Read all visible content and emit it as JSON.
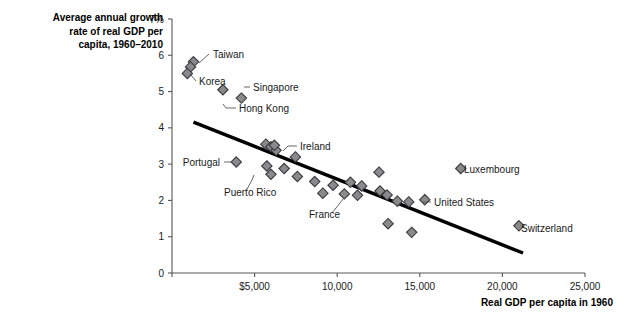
{
  "chart_data": {
    "type": "scatter",
    "title_lines": [
      "Average annual growth",
      "rate of real GDP per",
      "capita, 1960–2010"
    ],
    "xlabel": "Real GDP per capita in 1960",
    "ylabel": "Average annual growth rate of real GDP per capita, 1960–2010",
    "xlim": [
      0,
      25000
    ],
    "ylim": [
      0,
      7
    ],
    "grid": false,
    "legend": "none",
    "x_ticks": [
      {
        "value": 0,
        "label": ""
      },
      {
        "value": 5000,
        "label": "$5,000"
      },
      {
        "value": 10000,
        "label": "10,000"
      },
      {
        "value": 15000,
        "label": "15,000"
      },
      {
        "value": 20000,
        "label": "20,000"
      },
      {
        "value": 25000,
        "label": "25,000"
      }
    ],
    "y_ticks": [
      {
        "value": 0,
        "label": "0"
      },
      {
        "value": 1,
        "label": "1"
      },
      {
        "value": 2,
        "label": "2"
      },
      {
        "value": 3,
        "label": "3"
      },
      {
        "value": 4,
        "label": "4"
      },
      {
        "value": 5,
        "label": "5"
      },
      {
        "value": 6,
        "label": "6"
      },
      {
        "value": 7,
        "label": "7%"
      }
    ],
    "marker": {
      "shape": "diamond",
      "fill": "#8a8a8c",
      "edge": "#3a3a3c",
      "size": 8
    },
    "trend_line": {
      "color": "#000000",
      "width": 3.4,
      "x_start": 1300,
      "y_start": 4.16,
      "x_end": 21250,
      "y_end": 0.55
    },
    "points": [
      {
        "label": "Taiwan",
        "x": 1300,
        "y": 5.82
      },
      {
        "label": "",
        "x": 1120,
        "y": 5.68
      },
      {
        "label": "Korea",
        "x": 930,
        "y": 5.5
      },
      {
        "label": "Hong Kong",
        "x": 3080,
        "y": 5.05
      },
      {
        "label": "Singapore",
        "x": 4200,
        "y": 4.82
      },
      {
        "label": "",
        "x": 5680,
        "y": 3.55
      },
      {
        "label": "",
        "x": 5990,
        "y": 3.48
      },
      {
        "label": "",
        "x": 6300,
        "y": 3.38
      },
      {
        "label": "Portugal",
        "x": 3890,
        "y": 3.06
      },
      {
        "label": "",
        "x": 5740,
        "y": 2.95
      },
      {
        "label": "Puerto Rico",
        "x": 5990,
        "y": 2.72
      },
      {
        "label": "",
        "x": 6790,
        "y": 2.88
      },
      {
        "label": "",
        "x": 7470,
        "y": 3.2
      },
      {
        "label": "",
        "x": 7590,
        "y": 2.66
      },
      {
        "label": "",
        "x": 8640,
        "y": 2.52
      },
      {
        "label": "",
        "x": 9130,
        "y": 2.2
      },
      {
        "label": "",
        "x": 9750,
        "y": 2.42
      },
      {
        "label": "France",
        "x": 10430,
        "y": 2.18
      },
      {
        "label": "",
        "x": 10800,
        "y": 2.5
      },
      {
        "label": "",
        "x": 11230,
        "y": 2.14
      },
      {
        "label": "",
        "x": 11480,
        "y": 2.4
      },
      {
        "label": "",
        "x": 12530,
        "y": 2.78
      },
      {
        "label": "",
        "x": 12590,
        "y": 2.26
      },
      {
        "label": "",
        "x": 13020,
        "y": 2.15
      },
      {
        "label": "",
        "x": 13080,
        "y": 1.36
      },
      {
        "label": "",
        "x": 13640,
        "y": 1.98
      },
      {
        "label": "",
        "x": 14330,
        "y": 1.96
      },
      {
        "label": "",
        "x": 14510,
        "y": 1.12
      },
      {
        "label": "United States",
        "x": 15300,
        "y": 2.02
      },
      {
        "label": "Luxembourg",
        "x": 17480,
        "y": 2.88
      },
      {
        "label": "Switzerland",
        "x": 21000,
        "y": 1.3
      },
      {
        "label": "Ireland",
        "x": 6200,
        "y": 3.52
      }
    ],
    "annotations": [
      {
        "text": "Taiwan",
        "text_x": 213,
        "text_y": 58,
        "anchor": "start",
        "leader": [
          [
            209,
            54
          ],
          [
            199,
            63
          ]
        ]
      },
      {
        "text": "Korea",
        "text_x": 199,
        "text_y": 85,
        "anchor": "start",
        "leader": [
          [
            196,
            81
          ],
          [
            190,
            74
          ]
        ]
      },
      {
        "text": "Singapore",
        "text_x": 253,
        "text_y": 91,
        "anchor": "start",
        "leader": [
          [
            250,
            87
          ],
          [
            244,
            87
          ]
        ]
      },
      {
        "text": "Hong Kong",
        "text_x": 239,
        "text_y": 112,
        "anchor": "start",
        "leader": [
          [
            236,
            108
          ],
          [
            226,
            108
          ],
          [
            223,
            104
          ]
        ]
      },
      {
        "text": "Ireland",
        "text_x": 300,
        "text_y": 150,
        "anchor": "start",
        "leader": [
          [
            297,
            146
          ],
          [
            288,
            146
          ],
          [
            283,
            151
          ]
        ]
      },
      {
        "text": "Portugal",
        "text_x": 220,
        "text_y": 166,
        "anchor": "end",
        "leader": [
          [
            224,
            162
          ],
          [
            232,
            162
          ]
        ]
      },
      {
        "text": "Puerto Rico",
        "text_x": 224,
        "text_y": 196,
        "anchor": "start",
        "leader": [
          [
            246,
            191
          ],
          [
            252,
            180
          ],
          [
            254,
            175
          ]
        ]
      },
      {
        "text": "France",
        "text_x": 309,
        "text_y": 218,
        "anchor": "start",
        "leader": [
          [
            332,
            213
          ],
          [
            340,
            203
          ],
          [
            343,
            199
          ]
        ]
      },
      {
        "text": "United States",
        "text_x": 434,
        "text_y": 206,
        "anchor": "start",
        "leader": [
          [
            431,
            202
          ],
          [
            423,
            202
          ]
        ]
      },
      {
        "text": "Luxembourg",
        "text_x": 464,
        "text_y": 173,
        "anchor": "start",
        "leader": null
      },
      {
        "text": "Switzerland",
        "text_x": 521,
        "text_y": 232,
        "anchor": "start",
        "leader": null
      }
    ]
  },
  "layout": {
    "plot_left": 172,
    "plot_right": 585,
    "plot_top": 19,
    "plot_bottom": 273
  }
}
